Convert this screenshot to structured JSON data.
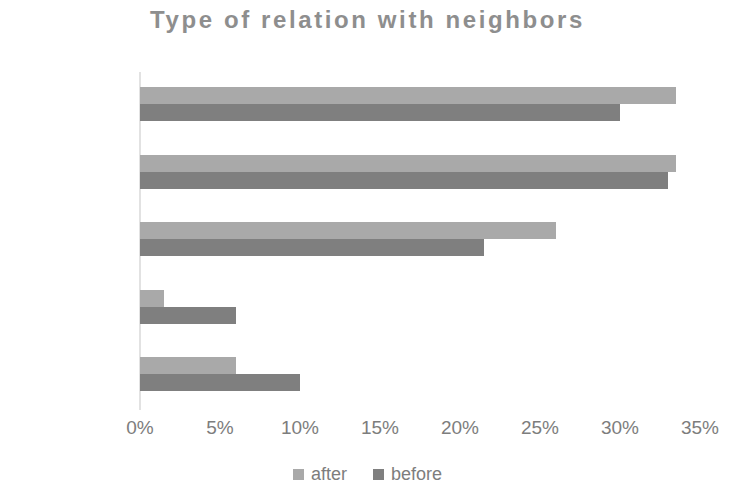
{
  "chart_data": {
    "type": "bar",
    "orientation": "horizontal",
    "title": "Type of relation with neighbors",
    "xlabel": "",
    "ylabel": "",
    "categories": [
      "close",
      "good",
      "formal",
      "hardly talk",
      "no relation"
    ],
    "series": [
      {
        "name": "after",
        "color": "#a9a9a9",
        "values": [
          33.5,
          33.5,
          26.0,
          1.5,
          6.0
        ]
      },
      {
        "name": "before",
        "color": "#7f7f7f",
        "values": [
          30.0,
          33.0,
          21.5,
          6.0,
          10.0
        ]
      }
    ],
    "xlim": [
      0,
      35
    ],
    "xticks": [
      0,
      5,
      10,
      15,
      20,
      25,
      30,
      35
    ],
    "xtick_labels": [
      "0%",
      "5%",
      "10%",
      "15%",
      "20%",
      "25%",
      "30%",
      "35%"
    ],
    "grid": false,
    "legend_position": "bottom",
    "value_unit": "%",
    "title_color": "#8e8e8e",
    "label_color": "#7d7d7d",
    "axis_color": "#e2e2e2"
  }
}
